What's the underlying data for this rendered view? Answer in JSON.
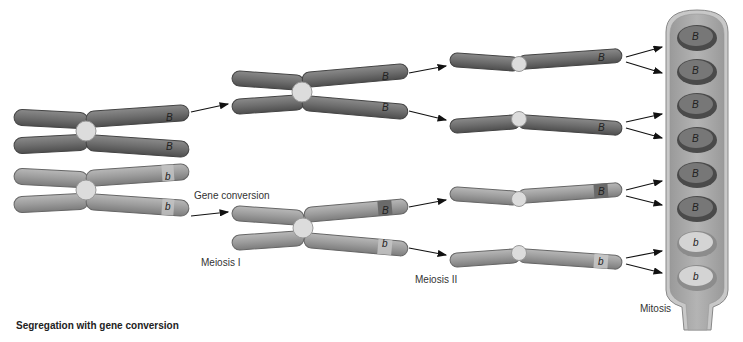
{
  "title": "Segregation with gene conversion",
  "labels": {
    "gene_conversion": "Gene conversion",
    "meiosis_1": "Meiosis I",
    "meiosis_2": "Meiosis II",
    "mitosis": "Mitosis"
  },
  "colors": {
    "dark_chromosome": "#6e6e6e",
    "light_chromosome": "#9c9c9c",
    "centromere": "#dcdcdc",
    "ascus": "#a8a8a8",
    "spore_dark": "#5a5a5a",
    "spore_light": "#c8c8c8"
  },
  "initial_pair": [
    {
      "shade": "dark",
      "alleles": [
        "B",
        "B"
      ]
    },
    {
      "shade": "light",
      "alleles": [
        "b",
        "b"
      ]
    }
  ],
  "meiosis_1_products": [
    {
      "shade": "dark",
      "alleles": [
        "B",
        "B"
      ]
    },
    {
      "shade": "light",
      "alleles": [
        "B",
        "b"
      ],
      "note": "Gene conversion"
    }
  ],
  "meiosis_2_products": [
    {
      "shade": "dark",
      "allele": "B"
    },
    {
      "shade": "dark",
      "allele": "B"
    },
    {
      "shade": "light",
      "allele": "B"
    },
    {
      "shade": "light",
      "allele": "b"
    }
  ],
  "mitosis_spores": [
    "B",
    "B",
    "B",
    "B",
    "B",
    "B",
    "b",
    "b"
  ]
}
